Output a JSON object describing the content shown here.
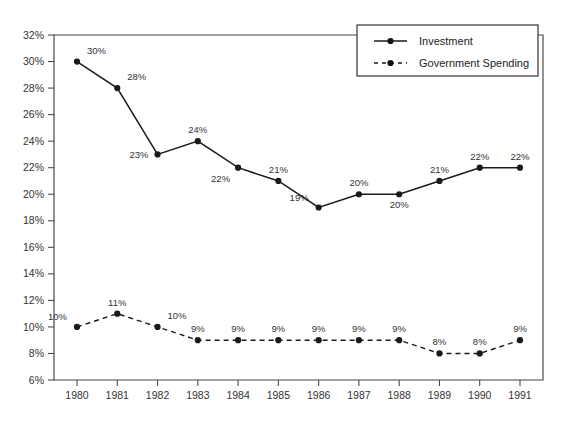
{
  "chart_data": {
    "type": "line",
    "title": "",
    "xlabel": "",
    "ylabel": "",
    "categories": [
      "1980",
      "1981",
      "1982",
      "1983",
      "1984",
      "1985",
      "1986",
      "1987",
      "1988",
      "1989",
      "1990",
      "1991"
    ],
    "ylim": [
      6,
      32
    ],
    "ytick_step": 2,
    "ytick_labels": [
      "6%",
      "8%",
      "10%",
      "12%",
      "14%",
      "16%",
      "18%",
      "20%",
      "22%",
      "24%",
      "26%",
      "28%",
      "30%",
      "32%"
    ],
    "grid": false,
    "legend_position": "top-right",
    "series": [
      {
        "name": "Investment",
        "style": "solid",
        "marker": "circle",
        "color": "#1a1a1a",
        "values": [
          30,
          28,
          23,
          24,
          22,
          21,
          19,
          20,
          20,
          21,
          22,
          22
        ],
        "data_labels": [
          "30%",
          "28%",
          "23%",
          "24%",
          "22%",
          "21%",
          "19%",
          "20%",
          "20%",
          "21%",
          "22%",
          "22%"
        ],
        "label_placement": [
          "above-right",
          "above-right",
          "left",
          "above",
          "below-left",
          "above",
          "above-left",
          "above",
          "below",
          "above",
          "above",
          "above"
        ]
      },
      {
        "name": "Government Spending",
        "style": "dashed",
        "marker": "circle",
        "color": "#1a1a1a",
        "values": [
          10,
          11,
          10,
          9,
          9,
          9,
          9,
          9,
          9,
          8,
          8,
          9
        ],
        "data_labels": [
          "10%",
          "11%",
          "10%",
          "9%",
          "9%",
          "9%",
          "9%",
          "9%",
          "9%",
          "8%",
          "8%",
          "9%"
        ],
        "label_placement": [
          "above-left",
          "above",
          "above-right",
          "above",
          "above",
          "above",
          "above",
          "above",
          "above",
          "above",
          "above",
          "above"
        ]
      }
    ]
  },
  "legend": {
    "entries": [
      {
        "label": "Investment",
        "style": "solid"
      },
      {
        "label": "Government Spending",
        "style": "dashed"
      }
    ]
  },
  "colors": {
    "background": "#ffffff",
    "axis": "#444444",
    "series": "#1a1a1a",
    "text": "#333333"
  }
}
